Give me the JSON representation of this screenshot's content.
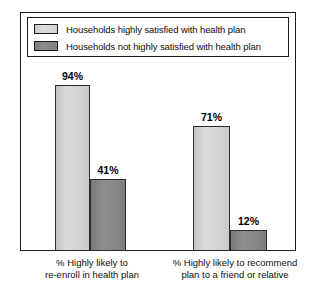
{
  "chart_data": {
    "type": "bar",
    "title": "",
    "xlabel": "",
    "ylabel": "",
    "ylim": [
      0,
      100
    ],
    "grid": false,
    "legend_position": "top",
    "categories": [
      "% Highly likely to re-enroll in health plan",
      "% Highly likely to recommend plan to a friend or relative"
    ],
    "series": [
      {
        "name": "Households highly satisfied with health plan",
        "color": "#d4d4d4",
        "values": [
          94,
          71
        ],
        "labels": [
          "94%",
          "71%"
        ]
      },
      {
        "name": "Households not highly satisfied with health plan",
        "color": "#868686",
        "values": [
          41,
          12
        ],
        "labels": [
          "41%",
          "12%"
        ]
      }
    ]
  },
  "legend": {
    "items": [
      {
        "label": "Households highly satisfied with health plan",
        "swatch": "light-gray-swatch"
      },
      {
        "label": "Households not highly satisfied with health plan",
        "swatch": "dark-gray-swatch"
      }
    ]
  },
  "axis": {
    "category_labels": [
      {
        "line1": "% Highly likely to",
        "line2": "re-enroll in health plan"
      },
      {
        "line1": "% Highly likely to recommend",
        "line2": "plan to a friend or relative"
      }
    ]
  },
  "bars": [
    {
      "value_label": "94%",
      "group": 0,
      "series": 0
    },
    {
      "value_label": "41%",
      "group": 0,
      "series": 1
    },
    {
      "value_label": "71%",
      "group": 1,
      "series": 0
    },
    {
      "value_label": "12%",
      "group": 1,
      "series": 1
    }
  ]
}
